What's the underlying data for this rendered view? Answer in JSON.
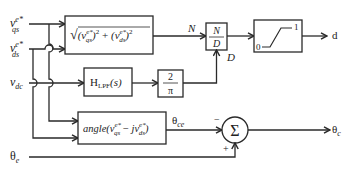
{
  "diagram": {
    "inputs": {
      "vqs": {
        "base": "v",
        "sup": "e*",
        "sub": "qs"
      },
      "vds": {
        "base": "v",
        "sup": "e*",
        "sub": "ds"
      },
      "vdc": {
        "base": "v",
        "sub": "dc"
      },
      "theta_e": {
        "base": "θ",
        "sub": "e"
      }
    },
    "blocks": {
      "magnitude": {
        "text": "√((v_qs^e*)² + (v_ds^e*)²)"
      },
      "divider": {
        "num": "N",
        "den": "D"
      },
      "saturation": {
        "low": "0",
        "high": "1"
      },
      "lpf": {
        "base": "H",
        "sub": "LPF",
        "arg": "(s)"
      },
      "gain": {
        "num": "2",
        "den": "π"
      },
      "angle": {
        "prefix": "angle(",
        "suffix": ")"
      },
      "sum": {
        "symbol": "Σ",
        "minus": "−",
        "plus": "+"
      }
    },
    "signals": {
      "N": "N",
      "D": "D",
      "theta_ce": {
        "base": "θ",
        "sub": "ce"
      }
    },
    "outputs": {
      "d": "d",
      "theta_c": {
        "base": "θ",
        "sub": "c"
      }
    }
  }
}
